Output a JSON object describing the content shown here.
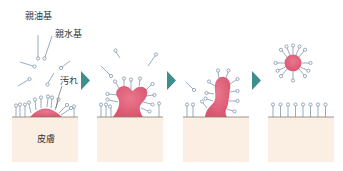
{
  "labels": {
    "lipophilic": "親油基",
    "hydrophilic": "親水基",
    "dirt": "汚れ",
    "skin": "皮膚"
  },
  "colors": {
    "skin": "#fbeee2",
    "skin_line": "#8a7a6a",
    "dirt": "#e0607a",
    "molecule_stroke": "#6f8aa0",
    "molecule_head": "#ffffff",
    "arrow": "#3e8e8e"
  },
  "steps": [
    {
      "id": 1,
      "description": "Surfactant molecules approach dirt on skin"
    },
    {
      "id": 2,
      "description": "Dirt is lifted by surfactant"
    },
    {
      "id": 3,
      "description": "Dirt detaches further"
    },
    {
      "id": 4,
      "description": "Dirt enclosed in micelle; skin surface covered"
    }
  ]
}
